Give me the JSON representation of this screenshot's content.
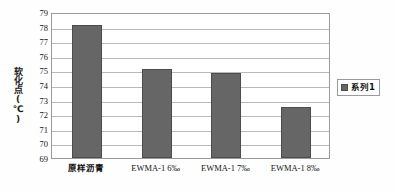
{
  "chart_data": {
    "type": "bar",
    "title": "",
    "xlabel": "",
    "ylabel": "软化点(℃)",
    "categories": [
      "原样沥青",
      "EWMA-1 6‰",
      "EWMA-1 7‰",
      "EWMA-1 8‰"
    ],
    "values": [
      78.1,
      75.1,
      74.8,
      72.5
    ],
    "ylim": [
      69,
      79
    ],
    "ytick_step": 1,
    "yticks": [
      79,
      78,
      77,
      76,
      75,
      74,
      73,
      72,
      71,
      70,
      69
    ],
    "grid": true,
    "legend": {
      "position": "right",
      "entries": [
        {
          "label": "系列1",
          "color": "#666666",
          "marker": "legend-swatch-square"
        }
      ]
    },
    "series": [
      {
        "name": "系列1",
        "color": "#666666",
        "values": [
          78.1,
          75.1,
          74.8,
          72.5
        ]
      }
    ]
  },
  "colors": {
    "bar_fill": "#666666",
    "bar_stroke": "#4c4c4c",
    "gridline": "#b9b9b9",
    "plot_border": "#9a9a9a",
    "text": "#141414",
    "background": "#ffffff"
  }
}
